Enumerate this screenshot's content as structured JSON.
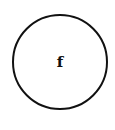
{
  "diagram": {
    "nodes": [
      {
        "id": "f",
        "label": "f",
        "shape": "circle",
        "cx": 60,
        "cy": 62,
        "r": 47
      }
    ],
    "edges": []
  },
  "colors": {
    "background": "#ffffff",
    "stroke": "#111111",
    "text": "#111111"
  }
}
